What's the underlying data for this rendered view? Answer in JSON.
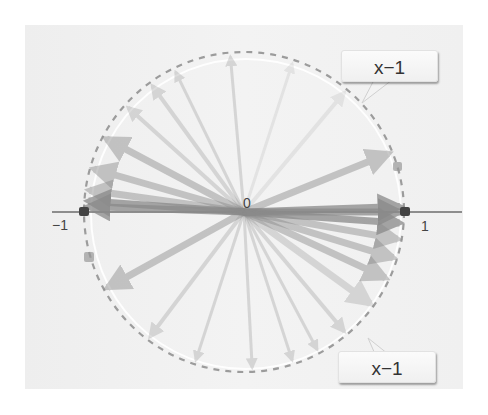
{
  "diagram": {
    "title": "",
    "center_label": "0",
    "left_label": "−1",
    "right_label": "1",
    "callouts": [
      {
        "label": "x−1",
        "position": "top-right"
      },
      {
        "label": "x−1",
        "position": "bottom-right"
      }
    ],
    "unit_circle": {
      "style": "dashed",
      "color": "#9a9a9a"
    },
    "arrow_color": "#8a8a8a",
    "vectors_degrees": [
      0,
      2,
      178,
      176,
      172,
      164,
      152,
      138,
      126,
      116,
      95,
      72,
      50,
      22,
      -4,
      -10,
      -17,
      -25,
      -36,
      -50,
      -62,
      -72,
      -87,
      -108,
      -127,
      -151
    ]
  }
}
